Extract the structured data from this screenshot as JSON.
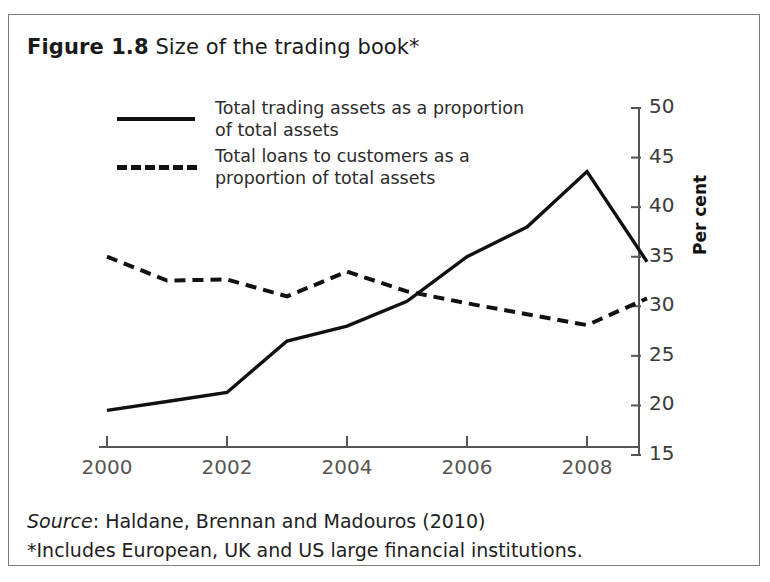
{
  "figure": {
    "number": "Figure 1.8",
    "title": "Size of the trading book*"
  },
  "footer": {
    "source_word": "Source",
    "source_rest": ": Haldane, Brennan and Madouros (2010)",
    "note": "*Includes European, UK and US large financial institutions."
  },
  "chart_data": {
    "type": "line",
    "title": "Size of the trading book*",
    "xlabel": "",
    "ylabel": "Per cent",
    "ylim": [
      15,
      50
    ],
    "xlim": [
      2000,
      2009
    ],
    "ytick_labels": [
      "50",
      "45",
      "40",
      "35",
      "30",
      "25",
      "20",
      "15"
    ],
    "ytick_values": [
      50,
      45,
      40,
      35,
      30,
      25,
      20,
      15
    ],
    "xtick_labels": [
      "2000",
      "2002",
      "2004",
      "2006",
      "2008"
    ],
    "xtick_values": [
      2000,
      2002,
      2004,
      2006,
      2008
    ],
    "x": [
      2000,
      2001,
      2002,
      2003,
      2004,
      2005,
      2006,
      2007,
      2008,
      2009
    ],
    "grid": false,
    "legend_position": "upper-left-inside",
    "series": [
      {
        "name": "Total trading assets as a proportion\nof total assets",
        "style": "solid",
        "color": "#111111",
        "values": [
          19.5,
          20.4,
          21.3,
          26.5,
          28.0,
          30.5,
          35.0,
          38.0,
          43.6,
          34.5
        ]
      },
      {
        "name": "Total loans to customers as a\nproportion of total assets",
        "style": "dashed",
        "color": "#111111",
        "values": [
          35.0,
          32.6,
          32.7,
          31.0,
          33.5,
          31.5,
          30.3,
          29.2,
          28.1,
          30.8
        ]
      }
    ]
  }
}
